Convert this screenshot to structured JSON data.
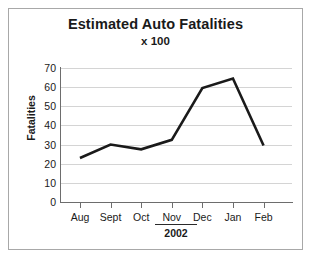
{
  "chart_data": {
    "type": "line",
    "title": "Estimated Auto Fatalities",
    "subtitle": "x 100",
    "xlabel": "2002",
    "ylabel": "Fatalities",
    "categories": [
      "Aug",
      "Sept",
      "Oct",
      "Nov",
      "Dec",
      "Jan",
      "Feb"
    ],
    "values": [
      23,
      30,
      27.5,
      32.5,
      59.5,
      64.5,
      29.5
    ],
    "series": [
      {
        "name": "Estimated Auto Fatalities",
        "values": [
          23,
          30,
          27.5,
          32.5,
          59.5,
          64.5,
          29.5
        ]
      }
    ],
    "ylim": [
      0,
      70
    ],
    "ytick_labels": [
      "70",
      "60",
      "50",
      "40",
      "30",
      "20",
      "10",
      "0"
    ],
    "ytick_values": [
      70,
      60,
      50,
      40,
      30,
      20,
      10,
      0
    ],
    "grid": true,
    "legend": "none",
    "line_color": "#1a1a1a",
    "grid_color": "#d4d4d4",
    "axis_color": "#6d6d6d",
    "background_color": "#ffffff",
    "border_color": "#a8a8a8"
  },
  "axis": {
    "y_title": "Fatalities",
    "x_year": "2002"
  }
}
